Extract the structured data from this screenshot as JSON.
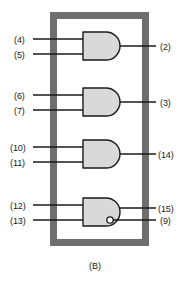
{
  "figure": {
    "caption": "(B)",
    "type": "logic-gate-package-pinout",
    "colors": {
      "package_outline": "#6e6e6e",
      "gate_fill": "#d9d9d9",
      "gate_stroke": "#1a1a1a",
      "wire": "#1a1a1a",
      "background": "#ffffff",
      "text": "#1a1a1a"
    },
    "package": {
      "x": 50,
      "y": 12,
      "width": 99,
      "height": 234,
      "border_width": 7
    },
    "gates": [
      {
        "id": "gate-1",
        "shape": "and",
        "inverted_output": false,
        "body": {
          "x": 83,
          "y": 32,
          "width": 23,
          "height": 28
        },
        "inputs": [
          {
            "pin": "(4)",
            "label_x": 14,
            "label_y": 36,
            "wire_y": 39
          },
          {
            "pin": "(5)",
            "label_x": 14,
            "label_y": 51,
            "wire_y": 54
          }
        ],
        "outputs": [
          {
            "pin": "(2)",
            "label_x": 160,
            "label_y": 43,
            "wire_y": 46
          }
        ]
      },
      {
        "id": "gate-2",
        "shape": "and",
        "inverted_output": false,
        "body": {
          "x": 83,
          "y": 88,
          "width": 23,
          "height": 28
        },
        "inputs": [
          {
            "pin": "(6)",
            "label_x": 14,
            "label_y": 92,
            "wire_y": 95
          },
          {
            "pin": "(7)",
            "label_x": 14,
            "label_y": 107,
            "wire_y": 110
          }
        ],
        "outputs": [
          {
            "pin": "(3)",
            "label_x": 160,
            "label_y": 99,
            "wire_y": 102
          }
        ]
      },
      {
        "id": "gate-3",
        "shape": "and",
        "inverted_output": false,
        "body": {
          "x": 83,
          "y": 140,
          "width": 23,
          "height": 28
        },
        "inputs": [
          {
            "pin": "(10)",
            "label_x": 10,
            "label_y": 144,
            "wire_y": 147
          },
          {
            "pin": "(11)",
            "label_x": 10,
            "label_y": 159,
            "wire_y": 162
          }
        ],
        "outputs": [
          {
            "pin": "(14)",
            "label_x": 158,
            "label_y": 151,
            "wire_y": 154
          }
        ]
      },
      {
        "id": "gate-4",
        "shape": "and",
        "inverted_output": true,
        "body": {
          "x": 83,
          "y": 198,
          "width": 23,
          "height": 28
        },
        "bubble": {
          "cx": 110,
          "cy": 220,
          "r": 3.2
        },
        "inputs": [
          {
            "pin": "(12)",
            "label_x": 10,
            "label_y": 202,
            "wire_y": 205
          },
          {
            "pin": "(13)",
            "label_x": 10,
            "label_y": 217,
            "wire_y": 220
          }
        ],
        "outputs": [
          {
            "pin": "(15)",
            "label_x": 158,
            "label_y": 205,
            "wire_y": 208
          },
          {
            "pin": "(9)",
            "label_x": 160,
            "label_y": 217,
            "wire_y": 220
          }
        ]
      }
    ]
  }
}
